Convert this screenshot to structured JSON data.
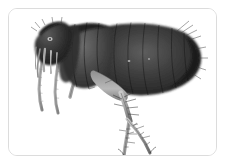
{
  "page": {
    "background_color": "#ffffff",
    "width": 227,
    "height": 165
  },
  "card": {
    "name": "photo-card",
    "background_color": "#ffffff",
    "border_color": "#dcdcdc",
    "border_radius_px": 9,
    "x": 8,
    "y": 8,
    "width": 209,
    "height": 148
  },
  "image": {
    "alt_text": "Grayscale microscope photograph of a flea in left lateral view",
    "subject": "flea",
    "view": "lateral",
    "orientation": "head at left, abdomen at right, legs extending downward and to the right",
    "rendering": "black and white photomicrograph on white background",
    "tones": {
      "background": "#ffffff",
      "body_dark": "#2b2b2b",
      "body_mid": "#585858",
      "body_light": "#9a9a9a",
      "leg_light": "#b8b8b8",
      "outline": "#1a1a1a"
    },
    "anatomy": [
      {
        "id": "head",
        "label": "head"
      },
      {
        "id": "eye",
        "label": "eye spot"
      },
      {
        "id": "maxillary-palps",
        "label": "maxillary palps"
      },
      {
        "id": "mouthparts",
        "label": "mouthparts"
      },
      {
        "id": "pronotum",
        "label": "pronotum"
      },
      {
        "id": "thorax",
        "label": "thorax"
      },
      {
        "id": "abdomen",
        "label": "abdomen"
      },
      {
        "id": "abdominal-segments",
        "label": "abdominal segments"
      },
      {
        "id": "posterior-bristles",
        "label": "posterior bristles"
      },
      {
        "id": "foreleg",
        "label": "foreleg"
      },
      {
        "id": "midleg",
        "label": "midleg"
      },
      {
        "id": "hindleg-femur",
        "label": "hind femur"
      },
      {
        "id": "hindleg-tibia",
        "label": "hind tibia"
      },
      {
        "id": "hindleg-tarsus",
        "label": "hind tarsus"
      },
      {
        "id": "claws",
        "label": "tarsal claws"
      },
      {
        "id": "setae",
        "label": "setae / spines"
      }
    ]
  }
}
